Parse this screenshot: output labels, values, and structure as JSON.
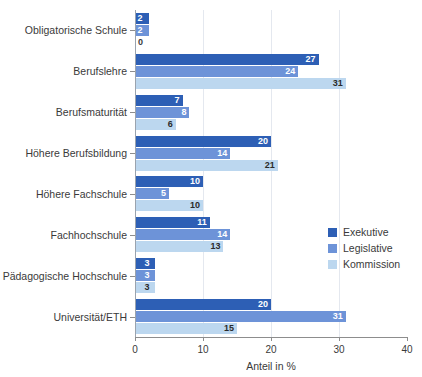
{
  "chart_data": {
    "type": "bar",
    "orientation": "horizontal",
    "title": "",
    "xlabel": "Anteil in %",
    "ylabel": "",
    "xlim": [
      0,
      40
    ],
    "xticks": [
      0,
      10,
      20,
      30,
      40
    ],
    "xtick_labels": [
      "0",
      "10",
      "20",
      "30",
      "40"
    ],
    "grid": "vertical",
    "legend_position": "right-middle",
    "categories": [
      "Obligatorische Schule",
      "Berufslehre",
      "Berufsmaturität",
      "Höhere Berufsbildung",
      "Höhere Fachschule",
      "Fachhochschule",
      "Pädagogische Hochschule",
      "Universität/ETH"
    ],
    "series": [
      {
        "name": "Exekutive",
        "color": "#2d5fb5",
        "values": [
          2,
          27,
          7,
          20,
          10,
          11,
          3,
          20
        ]
      },
      {
        "name": "Legislative",
        "color": "#6d93d8",
        "values": [
          2,
          24,
          8,
          14,
          5,
          14,
          3,
          31
        ]
      },
      {
        "name": "Kommission",
        "color": "#bcd7ef",
        "values": [
          0,
          31,
          6,
          21,
          10,
          13,
          3,
          15
        ]
      }
    ]
  },
  "legend": {
    "items": [
      {
        "label": "Exekutive",
        "color": "#2d5fb5"
      },
      {
        "label": "Legislative",
        "color": "#6d93d8"
      },
      {
        "label": "Kommission",
        "color": "#bcd7ef"
      }
    ]
  },
  "axis": {
    "x_title": "Anteil in %",
    "tick_labels": [
      "0",
      "10",
      "20",
      "30",
      "40"
    ]
  }
}
